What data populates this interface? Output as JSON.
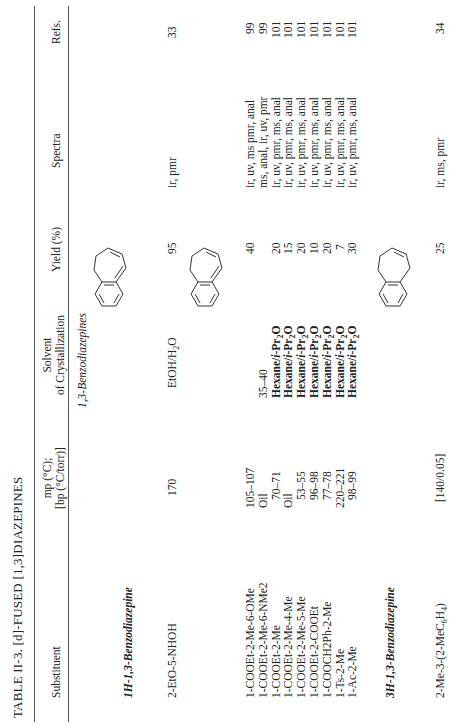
{
  "table": {
    "title": "TABLE II-3.  [d]-FUSED [1,3]DIAZEPINES",
    "columns": [
      {
        "key": "substituent",
        "label": "Substituent"
      },
      {
        "key": "mp",
        "label_line1": "mp (°C);",
        "label_line2": "[bp (°C/torr)]"
      },
      {
        "key": "solvent",
        "label_line1": "Solvent",
        "label_line2": "of Crystallization"
      },
      {
        "key": "yield",
        "label": "Yield (%)"
      },
      {
        "key": "spectra",
        "label": "Spectra"
      },
      {
        "key": "refs",
        "label": "Refs."
      }
    ],
    "section_heading": "1,3-Benzodiazepines",
    "groups": [
      {
        "heading": "1H-1,3-Benzodiazepine",
        "structure": "1H-1,3-benzodiazepine ring (numbered 1–9)",
        "rows": [
          {
            "substituent": "2-EtO-5-NHOH",
            "mp": "170",
            "solvent": "EtOH/H2O",
            "yield": "95",
            "spectra": "ir, pmr",
            "refs": "33"
          }
        ],
        "structure2": "1H-1,3-benzodiazepine (unnumbered)",
        "rows2": [
          {
            "substituent": "1-COOEt-2-Me-6-OMe",
            "mp": "105–107",
            "solvent": "",
            "yield": "40",
            "spectra": "ir, uv, ms pmr, anal",
            "refs": "99"
          },
          {
            "substituent": "1-COOEt-2-Me-6-NMe2",
            "mp": "Oil",
            "solvent": "35–40",
            "yield": "",
            "spectra": "ms, anal, ir, uv, pmr",
            "refs": "99"
          },
          {
            "substituent": "1-COOEt-2-Me",
            "mp": "70–71",
            "solvent": "Hexane/i-Pr2O",
            "yield": "20",
            "spectra": "ir, uv, pmr, ms, anal",
            "refs": "101"
          },
          {
            "substituent": "1-COOEt-2-Me-4-Me",
            "mp": "Oil",
            "solvent": "Hexane/i-Pr2O",
            "yield": "15",
            "spectra": "ir, uv, pmr, ms, anal",
            "refs": "101"
          },
          {
            "substituent": "1-COOEt-2-Me-5-Me",
            "mp": "53–55",
            "solvent": "Hexane/i-Pr2O",
            "yield": "20",
            "spectra": "ir, uv, pmr, ms, anal",
            "refs": "101"
          },
          {
            "substituent": "1-COOEt-2-COOEt",
            "mp": "96–98",
            "solvent": "Hexane/i-Pr2O",
            "yield": "10",
            "spectra": "ir, uv, pmr, ms, anal",
            "refs": "101"
          },
          {
            "substituent": "1-COOCH2Ph-2-Me",
            "mp": "77–78",
            "solvent": "Hexane/i-Pr2O",
            "yield": "20",
            "spectra": "ir, uv, pmr, ms, anal",
            "refs": "101"
          },
          {
            "substituent": "1-Ts-2-Me",
            "mp": "220–221",
            "solvent": "Hexane/i-Pr2O",
            "yield": "7",
            "spectra": "ir, uv, pmr, ms, anal",
            "refs": "101"
          },
          {
            "substituent": "1-Ac-2-Me",
            "mp": "98–99",
            "solvent": "Hexane/i-Pr2O",
            "yield": "30",
            "spectra": "ir, uv, pmr, ms, anal",
            "refs": "101"
          }
        ]
      },
      {
        "heading": "3H-1,3-Benzodiazepine",
        "structure": "3H-1,3-benzodiazepine ring",
        "rows": [
          {
            "substituent": "2-Me-3-(2-MeC6H4)",
            "mp": "[140/0.05]",
            "solvent": "",
            "yield": "25",
            "spectra": "ir, ms, pmr",
            "refs": "34"
          }
        ]
      }
    ],
    "ring_labels": {
      "n1": "1",
      "c2": "2",
      "n3": "3",
      "c4": "4",
      "c5": "5",
      "c6": "6",
      "c7": "7",
      "c8": "8",
      "c9": "9",
      "hn": "HN",
      "n": "N",
      "nh": "NH"
    }
  }
}
